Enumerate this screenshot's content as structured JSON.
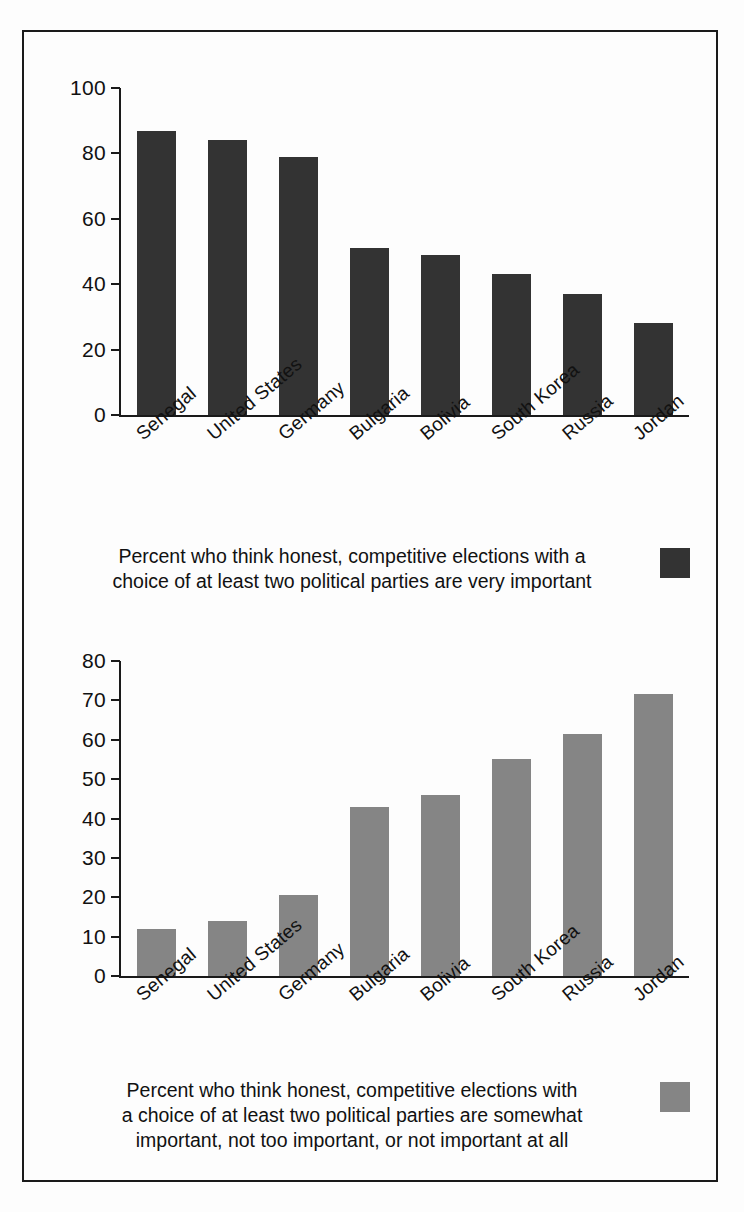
{
  "figure": {
    "background": "#fdfdfd",
    "border_color": "#1a1a1a"
  },
  "chart_data": [
    {
      "type": "bar",
      "title": "",
      "categories": [
        "Senegal",
        "United States",
        "Germany",
        "Bulgaria",
        "Bolivia",
        "South Korea",
        "Russia",
        "Jordan"
      ],
      "values": [
        87,
        84,
        79,
        51,
        49,
        43,
        37,
        28
      ],
      "xlabel": "",
      "ylabel": "",
      "ylim": [
        0,
        100
      ],
      "yticks": [
        0,
        20,
        40,
        60,
        80,
        100
      ],
      "grid": false,
      "legend": {
        "position": "below-right",
        "entries": [
          {
            "label": "Percent who think honest, competitive elections with a choice of at least two political parties are very important",
            "color": "#333333"
          }
        ]
      },
      "caption_line1": "Percent who think honest, competitive elections with a",
      "caption_line2": "choice of at least two political parties are very important",
      "bar_color": "#333333"
    },
    {
      "type": "bar",
      "title": "",
      "categories": [
        "Senegal",
        "United States",
        "Germany",
        "Bulgaria",
        "Bolivia",
        "South Korea",
        "Russia",
        "Jordan"
      ],
      "values": [
        12,
        14,
        20.5,
        43,
        46,
        55,
        61.5,
        71.5
      ],
      "xlabel": "",
      "ylabel": "",
      "ylim": [
        0,
        80
      ],
      "yticks": [
        0,
        10,
        20,
        30,
        40,
        50,
        60,
        70,
        80
      ],
      "grid": false,
      "legend": {
        "position": "below-right",
        "entries": [
          {
            "label": "Percent who think honest, competitive elections with a choice of at least two political parties are somewhat important, not too important, or not important at all",
            "color": "#858585"
          }
        ]
      },
      "caption_line1": "Percent who think honest, competitive elections with",
      "caption_line2": "a choice of at least two political parties are somewhat",
      "caption_line3": "important, not too important, or not important at all",
      "bar_color": "#858585"
    }
  ]
}
